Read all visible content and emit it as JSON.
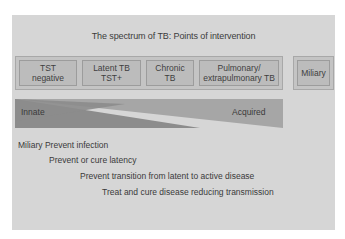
{
  "diagram": {
    "title": "The spectrum of TB: Points of intervention",
    "stages": [
      {
        "line1": "TST",
        "line2": "negative"
      },
      {
        "line1": "Latent TB",
        "line2": "TST+"
      },
      {
        "line1": "Chronic",
        "line2": "TB"
      },
      {
        "line1": "Pulmonary/",
        "line2": "extrapulmonary TB"
      }
    ],
    "miliary": {
      "label": "Miliary"
    },
    "immunity": {
      "left_label": "Innate",
      "right_label": "Acquired"
    },
    "interventions": [
      "Miliary Prevent infection",
      "Prevent or cure latency",
      "Prevent transition from latent to active disease",
      "Treat and cure disease reducing transmission"
    ],
    "colors": {
      "background": "#ffffff",
      "panel": "#d6d6d6",
      "box_fill": "#bcbcbc",
      "innate_triangle": "#8c8c8c",
      "acquired_triangle": "#a6a6a6"
    }
  }
}
